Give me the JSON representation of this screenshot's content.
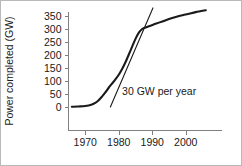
{
  "chart_data": {
    "type": "line",
    "title": "",
    "xlabel": "",
    "ylabel": "Power completed (GW)",
    "xlim": [
      1965,
      2008
    ],
    "ylim": [
      0,
      380
    ],
    "grid": false,
    "legend": null,
    "xticks": [
      1970,
      1980,
      1990,
      2000
    ],
    "xtick_labels": [
      "1970",
      "1980",
      "1990",
      "2000"
    ],
    "yticks": [
      0,
      50,
      100,
      150,
      200,
      250,
      300,
      350
    ],
    "ytick_labels": [
      "0",
      "50",
      "100",
      "150",
      "200",
      "250",
      "300",
      "350"
    ],
    "series": [
      {
        "name": "Cumulative nuclear power completed",
        "style": "thick-solid",
        "x": [
          1966,
          1968,
          1970,
          1972,
          1973,
          1974,
          1975,
          1976,
          1977,
          1978,
          1979,
          1980,
          1981,
          1982,
          1983,
          1984,
          1985,
          1986,
          1987,
          1988,
          1989,
          1991,
          1993,
          1995,
          1997,
          1999,
          2001,
          2003,
          2006
        ],
        "y": [
          1,
          2,
          4,
          10,
          16,
          26,
          40,
          56,
          74,
          90,
          106,
          124,
          146,
          172,
          202,
          232,
          262,
          286,
          300,
          306,
          311,
          320,
          329,
          338,
          346,
          353,
          359,
          365,
          372
        ]
      }
    ],
    "annotations": [
      {
        "name": "slope-tangent",
        "type": "line",
        "label": "30 GW per year",
        "slope_gw_per_year": 30,
        "x": [
          1977.5,
          1990.2
        ],
        "y": [
          0,
          381
        ],
        "label_x": 1981.0,
        "label_y": 48
      }
    ]
  }
}
